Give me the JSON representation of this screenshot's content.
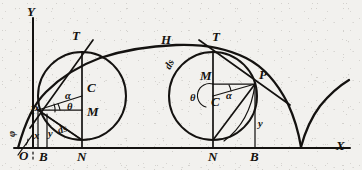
{
  "figure": {
    "ink_color": "#141210",
    "paper_color": "#f2f1ee",
    "axes": {
      "y_label": "Y",
      "x_label": "X",
      "origin_label": "O"
    },
    "curve_label": "H",
    "left_construction": {
      "point_p": "P",
      "point_c": "C",
      "point_m": "M",
      "point_t": "T",
      "point_n": "N",
      "point_b": "B",
      "angle_alpha": "α",
      "angle_theta": "θ",
      "angle_phi": "φ",
      "seg_x": "x",
      "seg_y": "y",
      "seg_ds": "ds"
    },
    "right_construction": {
      "point_p": "P",
      "point_c": "C",
      "point_m": "M",
      "point_t": "T",
      "point_n": "N",
      "point_b": "B",
      "angle_alpha": "α",
      "angle_theta": "θ",
      "seg_y": "y",
      "arc_ds": "ds"
    }
  }
}
